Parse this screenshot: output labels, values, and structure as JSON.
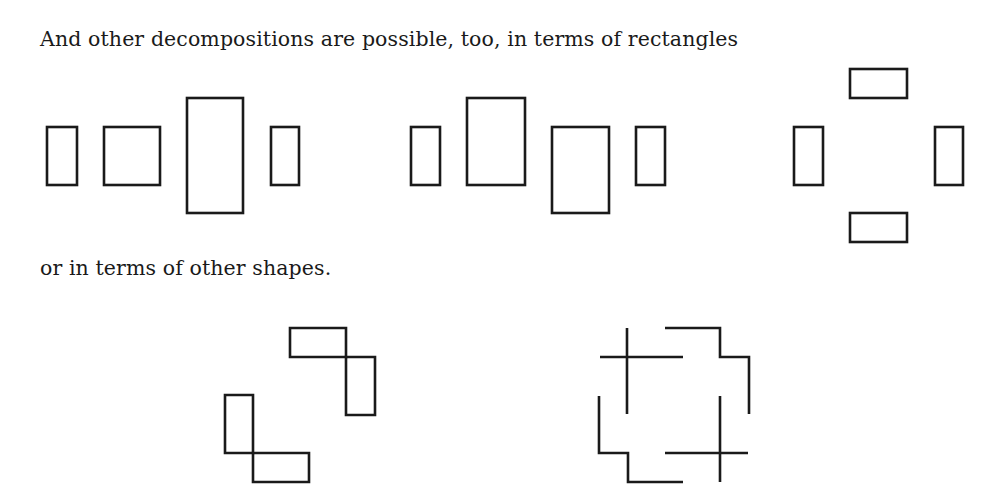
{
  "text": {
    "line1": "And other decompositions are possible, too, in terms of rectangles",
    "line2": "or in terms of other shapes."
  },
  "figures": {
    "rect_decomposition_1": [
      {
        "x": 47,
        "y": 127,
        "w": 30,
        "h": 58
      },
      {
        "x": 104,
        "y": 127,
        "w": 56,
        "h": 58
      },
      {
        "x": 187,
        "y": 98,
        "w": 56,
        "h": 115
      },
      {
        "x": 271,
        "y": 127,
        "w": 28,
        "h": 58
      }
    ],
    "rect_decomposition_2": [
      {
        "x": 411,
        "y": 127,
        "w": 29,
        "h": 58
      },
      {
        "x": 467,
        "y": 98,
        "w": 58,
        "h": 87
      },
      {
        "x": 552,
        "y": 127,
        "w": 57,
        "h": 86
      },
      {
        "x": 636,
        "y": 127,
        "w": 29,
        "h": 58
      }
    ],
    "rect_decomposition_3": [
      {
        "x": 850,
        "y": 69,
        "w": 57,
        "h": 29
      },
      {
        "x": 794,
        "y": 127,
        "w": 29,
        "h": 58
      },
      {
        "x": 935,
        "y": 127,
        "w": 28,
        "h": 58
      },
      {
        "x": 850,
        "y": 213,
        "w": 57,
        "h": 29
      }
    ],
    "shape_decomposition_1": [
      "M290 328 H346 V357 H290 Z",
      "M346 357 H375 V415 H346 Z",
      "M225 395 H253 V453 H225 Z",
      "M253 453 H309 V482 H253 Z"
    ],
    "shape_decomposition_2": [
      "M627 328 V414 M600 357 H683",
      "M665 328 H720 V357 H749 V414",
      "M599 396 V453 H628 V482 H683",
      "M720 396 V482 M665 453 H748"
    ]
  }
}
